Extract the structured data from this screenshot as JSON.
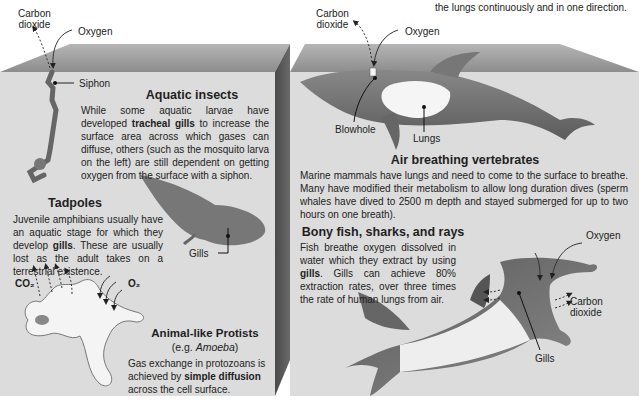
{
  "top_text": "the lungs continuously and in one direction.",
  "left_panel": {
    "labels": {
      "carbon_dioxide": "Carbon\ndioxide",
      "oxygen": "Oxygen",
      "siphon": "Siphon",
      "gills": "Gills",
      "co2": "CO₂",
      "o2": "O₂"
    },
    "aquatic_insects": {
      "title": "Aquatic insects",
      "text_pre": "While some aquatic larvae have developed ",
      "text_bold": "tracheal gills",
      "text_post": " to increase the surface area across which gases can diffuse, others (such as the mosquito larva on the left) are still dependent on getting oxygen from the surface with a siphon."
    },
    "tadpoles": {
      "title": "Tadpoles",
      "text_pre": "Juvenile amphibians usually have an aquatic stage for which they develop ",
      "text_bold": "gills",
      "text_post": ". These are usually lost as the adult takes on a terrestrial existence."
    },
    "protists": {
      "title": "Animal-like Protists",
      "subtitle_pre": "(e.g. ",
      "subtitle_italic": "Amoeba",
      "subtitle_post": ")",
      "text_pre": "Gas exchange in protozoans is achieved by ",
      "text_bold": "simple diffusion",
      "text_post": " across the cell surface."
    }
  },
  "right_panel": {
    "labels": {
      "carbon_dioxide": "Carbon\ndioxide",
      "oxygen": "Oxygen",
      "blowhole": "Blowhole",
      "lungs": "Lungs",
      "shark_oxygen": "Oxygen",
      "shark_carbon_dioxide": "Carbon\ndioxide",
      "shark_gills": "Gills"
    },
    "air_breathing": {
      "title": "Air breathing vertebrates",
      "text": "Marine mammals have lungs and need to come to the surface to breathe. Many have modified their metabolism to allow long duration dives (sperm whales have dived to 2500 m depth and stayed submerged for up to two hours on one breath)."
    },
    "fish": {
      "title": "Bony fish, sharks, and rays",
      "text_pre": "Fish breathe oxygen dissolved in water which they extract by using ",
      "text_bold": "gills",
      "text_post": ". Gills can achieve 80% extraction rates, over three times the rate of human lungs from air."
    }
  },
  "colors": {
    "panel_face": "#dadada",
    "panel_top": "#9a9a9a",
    "panel_side": "#5a5a5a",
    "animal_dark": "#6f6f6f",
    "animal_light": "#f2f2f2"
  }
}
